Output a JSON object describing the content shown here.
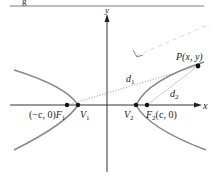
{
  "figure": {
    "type": "hyperbola",
    "caption_partial": "g",
    "axes": {
      "x_label": "x",
      "y_label": "y"
    },
    "points": {
      "P": "P(x, y)",
      "F1_coord": "(−c, 0)",
      "F1": "F",
      "F1_sub": "1",
      "V1": "V",
      "V1_sub": "1",
      "V2": "V",
      "V2_sub": "2",
      "F2": "F",
      "F2_sub": "2",
      "F2_coord": "(c, 0)"
    },
    "distances": {
      "d1": "d",
      "d1_sub": "1",
      "d2": "d",
      "d2_sub": "2"
    },
    "colors": {
      "curve": "#8a8a8a",
      "axis": "#333333",
      "point": "#111111",
      "dotted": "#9a9a9a",
      "rule": "#7a7a7a"
    }
  }
}
